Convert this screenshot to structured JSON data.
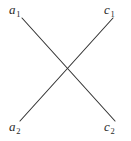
{
  "figure": {
    "width": 131,
    "height": 141,
    "background_color": "#ffffff",
    "line_color": "#333333",
    "line_width": 1.1,
    "text_color": "#2b2b2b"
  },
  "labels": {
    "top_left": {
      "base": "a",
      "subscript": "1",
      "full": "a1"
    },
    "top_right": {
      "base": "c",
      "subscript": "1",
      "full": "c1"
    },
    "bottom_left": {
      "base": "a",
      "subscript": "2",
      "full": "a2"
    },
    "bottom_right": {
      "base": "c",
      "subscript": "2",
      "full": "c2"
    }
  },
  "chart_data": {
    "type": "diagram",
    "title": "",
    "nodes": [
      {
        "id": "a1",
        "label": "a1",
        "x": 15,
        "y": 10
      },
      {
        "id": "c1",
        "label": "c1",
        "x": 112,
        "y": 10
      },
      {
        "id": "a2",
        "label": "a2",
        "x": 15,
        "y": 127
      },
      {
        "id": "c2",
        "label": "c2",
        "x": 112,
        "y": 127
      }
    ],
    "edges": [
      {
        "from": "a1",
        "to": "c2",
        "x1": 22,
        "y1": 18,
        "x2": 115,
        "y2": 121
      },
      {
        "from": "a2",
        "to": "c1",
        "x1": 20,
        "y1": 121,
        "x2": 113,
        "y2": 18
      }
    ],
    "crossing_point": {
      "x": 67,
      "y": 70
    }
  }
}
